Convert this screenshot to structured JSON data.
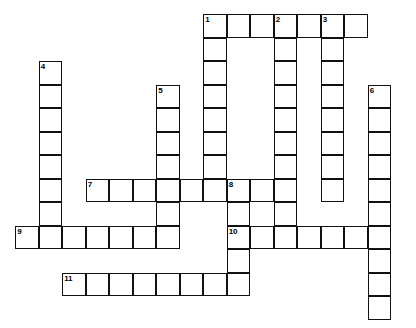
{
  "puzzle": {
    "title": "Crossword Puzzle Grid",
    "cell_size": 23.5,
    "origin_x": 15,
    "origin_y": 14,
    "cols": 16,
    "rows": 13,
    "line_color": "#111111",
    "cell_fill": "#ffffff",
    "background": "#ffffff",
    "number_font_size": 8
  },
  "entries": [
    {
      "number": "1",
      "direction": "across",
      "row": 0,
      "col": 8,
      "length": 7
    },
    {
      "number": "1",
      "direction": "down",
      "row": 0,
      "col": 8,
      "length": 8
    },
    {
      "number": "2",
      "direction": "down",
      "row": 0,
      "col": 11,
      "length": 9
    },
    {
      "number": "3",
      "direction": "down",
      "row": 0,
      "col": 13,
      "length": 8
    },
    {
      "number": "4",
      "direction": "down",
      "row": 2,
      "col": 1,
      "length": 8
    },
    {
      "number": "5",
      "direction": "down",
      "row": 3,
      "col": 6,
      "length": 7
    },
    {
      "number": "6",
      "direction": "down",
      "row": 3,
      "col": 15,
      "length": 10
    },
    {
      "number": "7",
      "direction": "across",
      "row": 7,
      "col": 3,
      "length": 9
    },
    {
      "number": "8",
      "direction": "down",
      "row": 7,
      "col": 9,
      "length": 5
    },
    {
      "number": "9",
      "direction": "across",
      "row": 9,
      "col": 0,
      "length": 7
    },
    {
      "number": "10",
      "direction": "across",
      "row": 9,
      "col": 9,
      "length": 7
    },
    {
      "number": "11",
      "direction": "across",
      "row": 11,
      "col": 2,
      "length": 8
    }
  ],
  "numbered_cells": [
    {
      "number": "1",
      "row": 0,
      "col": 8
    },
    {
      "number": "2",
      "row": 0,
      "col": 11
    },
    {
      "number": "3",
      "row": 0,
      "col": 13
    },
    {
      "number": "4",
      "row": 2,
      "col": 1
    },
    {
      "number": "5",
      "row": 3,
      "col": 6
    },
    {
      "number": "6",
      "row": 3,
      "col": 15
    },
    {
      "number": "7",
      "row": 7,
      "col": 3
    },
    {
      "number": "8",
      "row": 7,
      "col": 9
    },
    {
      "number": "9",
      "row": 9,
      "col": 0
    },
    {
      "number": "10",
      "row": 9,
      "col": 9
    },
    {
      "number": "11",
      "row": 11,
      "col": 2
    }
  ]
}
